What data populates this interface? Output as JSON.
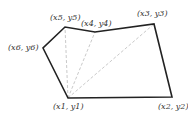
{
  "diagram": {
    "title": "",
    "polygon": {
      "stroke": "#222222",
      "vertices": [
        {
          "id": "p1",
          "label": "(x1, y1)",
          "x": 68,
          "y": 98,
          "lx": 53,
          "ly": 102
        },
        {
          "id": "p2",
          "label": "(x2, y2)",
          "x": 172,
          "y": 97,
          "lx": 158,
          "ly": 102
        },
        {
          "id": "p3",
          "label": "(x3, y3)",
          "x": 154,
          "y": 24,
          "lx": 137,
          "ly": 9
        },
        {
          "id": "p4",
          "label": "(x4, y4)",
          "x": 95,
          "y": 32,
          "lx": 81,
          "ly": 19
        },
        {
          "id": "p5",
          "label": "(x5, y5)",
          "x": 65,
          "y": 27,
          "lx": 50,
          "ly": 13
        },
        {
          "id": "p6",
          "label": "(x6, y6)",
          "x": 43,
          "y": 48,
          "lx": 8,
          "ly": 43
        }
      ]
    },
    "diagonals": {
      "stroke": "#bbbbbb",
      "style": "dashed",
      "from": "p1",
      "to": [
        "p3",
        "p4",
        "p5"
      ]
    }
  }
}
